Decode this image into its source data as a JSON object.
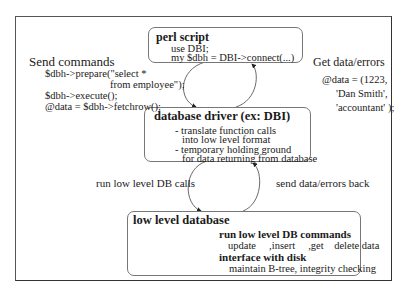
{
  "diagram": {
    "perl_script": {
      "title": "perl script",
      "lines": [
        "use DBI;",
        "my $dbh = DBI->connect(...)"
      ]
    },
    "database_driver": {
      "title": "database driver (ex: DBI)",
      "lines": [
        "- translate function calls",
        "into low level format",
        "- temporary holding ground",
        "for data returning from database"
      ]
    },
    "low_level_database": {
      "title": "low level database",
      "section1_title": "run low level DB commands",
      "section1_line": "update     ,insert     ,get    delete data",
      "section2_title": "interface with disk",
      "section2_line": "maintain B-tree, integrity checking",
      "icon": "database-cylinder-icon"
    },
    "send_commands": {
      "title": "Send commands",
      "lines": [
        "$dbh->prepare(\"select *",
        "from employee\");",
        "$dbh->execute();",
        "@data = $dbh->fetchrow();"
      ]
    },
    "get_data": {
      "title": "Get data/errors",
      "lines": [
        "@data = (1223,",
        "'Dan Smith',",
        "'accountant' );"
      ]
    },
    "arrows": {
      "left_lower": "run low level DB calls",
      "right_lower": "send data/errors back"
    }
  }
}
